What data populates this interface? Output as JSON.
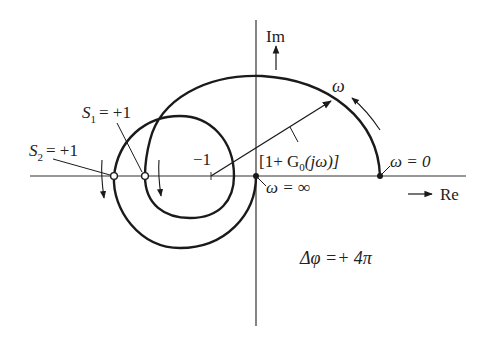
{
  "axes": {
    "real_label": "Re",
    "imag_label": "Im"
  },
  "labels": {
    "minus_one": "−1",
    "vector": "[1+ G",
    "vector_sub": "0",
    "vector_tail": "(jω)]",
    "omega": "ω",
    "omega_zero": "ω = 0",
    "omega_inf": "ω = ∞",
    "s1": "S",
    "s1_sub": "1",
    "s1_val": "= +1",
    "s2": "S",
    "s2_sub": "2",
    "s2_val": "= +1",
    "phase": "Δφ =+ 4π"
  },
  "colors": {
    "stroke": "#1a1a1a",
    "text": "#222222"
  }
}
